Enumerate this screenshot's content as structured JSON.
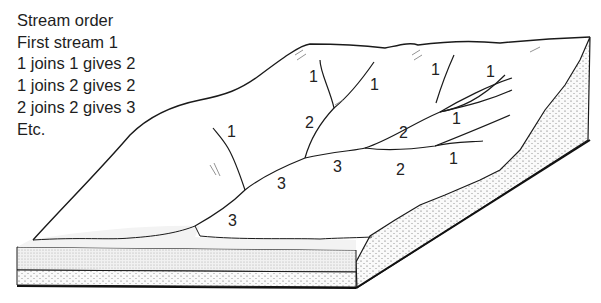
{
  "legend": {
    "title": "Stream order",
    "lines": [
      "First stream 1",
      "1 joins 1 gives 2",
      "1 joins 2 gives 2",
      "2 joins 2 gives 3",
      "Etc."
    ]
  },
  "stream_labels": [
    {
      "text": "1",
      "x": 309,
      "y": 82
    },
    {
      "text": "1",
      "x": 370,
      "y": 90
    },
    {
      "text": "1",
      "x": 431,
      "y": 75
    },
    {
      "text": "1",
      "x": 486,
      "y": 77
    },
    {
      "text": "1",
      "x": 227,
      "y": 137
    },
    {
      "text": "2",
      "x": 305,
      "y": 128
    },
    {
      "text": "2",
      "x": 399,
      "y": 138
    },
    {
      "text": "1",
      "x": 452,
      "y": 124
    },
    {
      "text": "3",
      "x": 333,
      "y": 172
    },
    {
      "text": "2",
      "x": 396,
      "y": 175
    },
    {
      "text": "1",
      "x": 449,
      "y": 164
    },
    {
      "text": "3",
      "x": 277,
      "y": 189
    },
    {
      "text": "3",
      "x": 228,
      "y": 226
    }
  ],
  "colors": {
    "line": "#1a1a1a",
    "stipple": "#d8d8d8",
    "background": "#ffffff"
  }
}
